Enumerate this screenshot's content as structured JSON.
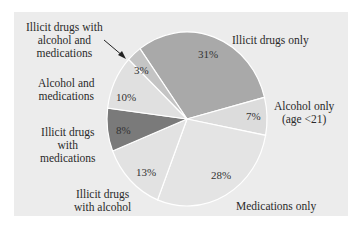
{
  "chart_data": {
    "type": "pie",
    "title": "",
    "categories": [
      "Illicit drugs only",
      "Alcohol only (age <21)",
      "Medications only",
      "Illicit drugs with alcohol",
      "Illicit drugs with medications",
      "Alcohol and medications",
      "Illicit drugs with alcohol and medications"
    ],
    "values": [
      31,
      7,
      28,
      13,
      8,
      10,
      3
    ],
    "value_labels": [
      "31%",
      "7%",
      "28%",
      "13%",
      "8%",
      "10%",
      "3%"
    ],
    "colors": [
      "#a9a9a9",
      "#dcdcdc",
      "#e4e4e4",
      "#e2e2e2",
      "#7a7a7a",
      "#e0e0e0",
      "#c4c4c4"
    ],
    "legend": "none (direct labels)",
    "start_angle_deg": -36,
    "direction": "clockwise"
  },
  "labels": {
    "illicit_only": "Illicit drugs only",
    "alcohol_only_1": "Alcohol only",
    "alcohol_only_2": "(age <21)",
    "meds_only": "Medications only",
    "illicit_alcohol_1": "Illicit drugs",
    "illicit_alcohol_2": "with alcohol",
    "illicit_meds_1": "Illicit drugs",
    "illicit_meds_2": "with",
    "illicit_meds_3": "medications",
    "alcohol_meds_1": "Alcohol and",
    "alcohol_meds_2": "medications",
    "illicit_alc_meds_1": "Illicit drugs with",
    "illicit_alc_meds_2": "alcohol and",
    "illicit_alc_meds_3": "medications"
  },
  "percents": {
    "illicit_only": "31%",
    "alcohol_only": "7%",
    "meds_only": "28%",
    "illicit_alcohol": "13%",
    "illicit_meds": "8%",
    "alcohol_meds": "10%",
    "illicit_alc_meds": "3%"
  }
}
